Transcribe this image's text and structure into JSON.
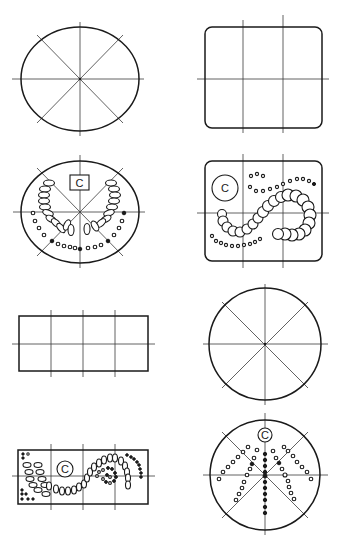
{
  "diagram": {
    "type": "layout-patterns",
    "colors": {
      "ink": "#1a1a1a",
      "background": "#ffffff"
    },
    "panels": [
      {
        "id": "p1",
        "shape": "ellipse",
        "guides": "8-way radial",
        "pattern": "empty"
      },
      {
        "id": "p2",
        "shape": "rounded-rectangle",
        "guides": "3x2 grid",
        "pattern": "empty"
      },
      {
        "id": "p3",
        "shape": "ellipse",
        "guides": "8-way radial",
        "pattern": "horseshoe arcs of ovals and dots",
        "label": "C"
      },
      {
        "id": "p4",
        "shape": "rounded-rectangle",
        "guides": "3x2 grid",
        "pattern": "S-curve of circles with dotted arcs",
        "label": "C"
      },
      {
        "id": "p5",
        "shape": "rectangle",
        "guides": "4x2 grid",
        "pattern": "empty"
      },
      {
        "id": "p6",
        "shape": "circle",
        "guides": "8-way radial",
        "pattern": "empty"
      },
      {
        "id": "p7",
        "shape": "rectangle",
        "guides": "4x2 grid",
        "pattern": "spiral of ovals and dots",
        "label": "C"
      },
      {
        "id": "p8",
        "shape": "circle",
        "guides": "8-way radial",
        "pattern": "radiating rows of dots",
        "label": "C"
      }
    ],
    "labels": {
      "p3": "C",
      "p4": "C",
      "p7": "C",
      "p8": "C"
    }
  }
}
